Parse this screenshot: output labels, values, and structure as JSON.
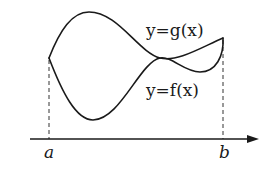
{
  "diagram": {
    "labels": {
      "g_curve": "y=g(x)",
      "f_curve": "y=f(x)",
      "a": "a",
      "b": "b"
    },
    "colors": {
      "stroke": "#1a1a1a",
      "background": "#ffffff"
    },
    "elements": [
      {
        "type": "curve",
        "name": "g",
        "label": "y=g(x)"
      },
      {
        "type": "curve",
        "name": "f",
        "label": "y=f(x)"
      },
      {
        "type": "axis",
        "direction": "horizontal",
        "arrow": "right"
      },
      {
        "type": "dashed-line",
        "at": "a"
      },
      {
        "type": "dashed-line",
        "at": "b"
      }
    ]
  }
}
